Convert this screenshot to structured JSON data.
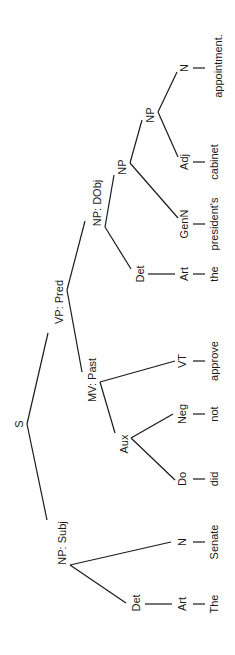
{
  "diagram": {
    "type": "syntax-tree",
    "orientation": "rotated-90-ccw",
    "sentence": "The Senate did not approve the president's cabinet appointment.",
    "line_color": "#1a1a1a",
    "nodes": {
      "root": "S",
      "np_subj": "NP: Subj",
      "vp_pred": "VP: Pred",
      "det_subj": "Det",
      "art_subj": "Art",
      "word_the_cap": "The",
      "n_subj": "N",
      "word_senate": "Senate",
      "mv_past": "MV: Past",
      "aux": "Aux",
      "do": "Do",
      "word_did": "did",
      "neg": "Neg",
      "word_not": "not",
      "vt": "VT",
      "word_approve": "approve",
      "np_dobj": "NP: DObj",
      "det_obj": "Det",
      "art_obj": "Art",
      "word_the": "the",
      "np_inner1": "NP",
      "genn": "GenN",
      "word_presidents": "president's",
      "np_inner2": "NP",
      "adj": "Adj",
      "word_cabinet": "cabinet",
      "n_obj": "N",
      "word_appointment": "appointment."
    }
  }
}
